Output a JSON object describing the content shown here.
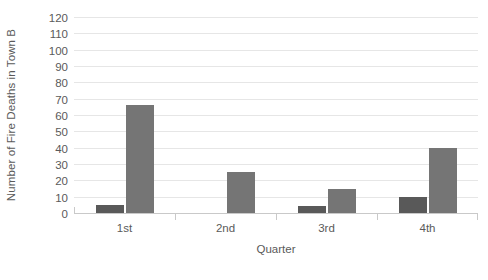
{
  "chart_data": {
    "type": "bar",
    "title": "",
    "subtitle": "",
    "xlabel": "Quarter",
    "ylabel": "Number of Fire Deaths in Town B",
    "categories": [
      "1st",
      "2nd",
      "3rd",
      "4th"
    ],
    "series": [
      {
        "name": "Series 1",
        "color": "#595959",
        "values": [
          5,
          0,
          4,
          10
        ]
      },
      {
        "name": "Series 2",
        "color": "#757575",
        "values": [
          66,
          25,
          15,
          40
        ]
      }
    ],
    "ylim": [
      0,
      120
    ],
    "ytick_step": 10,
    "yticks": [
      0,
      10,
      20,
      30,
      40,
      50,
      60,
      70,
      80,
      90,
      100,
      110,
      120
    ],
    "ytick_labels": [
      "0",
      "10",
      "20",
      "30",
      "40",
      "50",
      "60",
      "70",
      "80",
      "90",
      "100",
      "110",
      "120"
    ],
    "grid": true,
    "grid_axis": "y",
    "grid_color": "#e6e6e6",
    "legend": false,
    "legend_position": "none",
    "axis_color": "#c9c9c9",
    "text_color": "#5a5a5a",
    "background_color": "#ffffff",
    "plot_background_color": "#ffffff"
  }
}
